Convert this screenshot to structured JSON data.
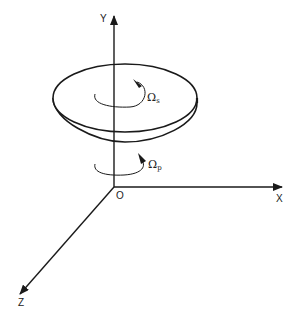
{
  "diagram": {
    "axes": {
      "x_label": "X",
      "y_label": "Y",
      "z_label": "Z",
      "origin_label": "O"
    },
    "rotations": [
      {
        "symbol": "Ω",
        "subscript": "s",
        "meaning": "spin of disc"
      },
      {
        "symbol": "Ω",
        "subscript": "p",
        "meaning": "precession about Y"
      }
    ],
    "colors": {
      "stroke": "#1a1a1a",
      "background": "#ffffff"
    }
  }
}
